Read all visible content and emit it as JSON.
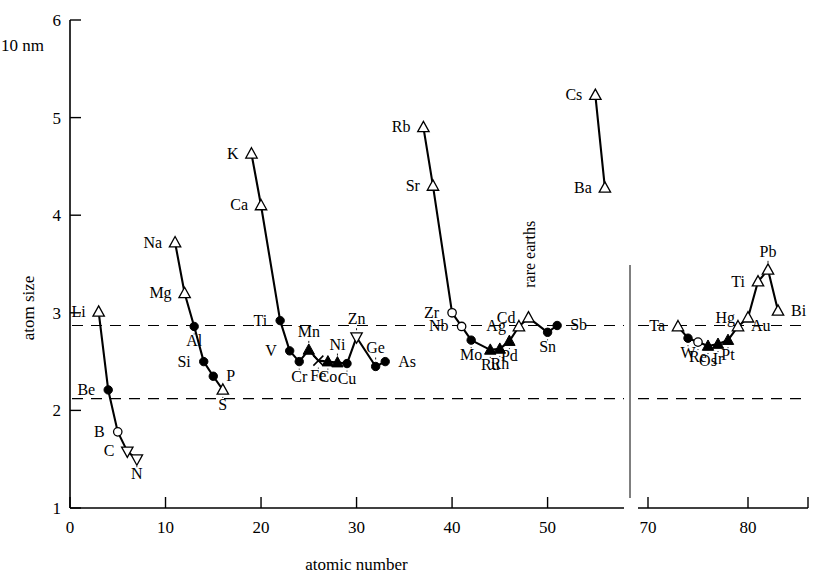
{
  "figure": {
    "y_axis_title": "atom size",
    "y_unit_label": "10 nm",
    "x_axis_title": "atomic number",
    "rare_earths_label": "rare earths"
  },
  "chart_data": {
    "type": "line",
    "title": "",
    "xlabel": "atomic number",
    "ylabel": "atom size",
    "y_unit": "10 nm",
    "xlim": [
      0,
      86
    ],
    "ylim": [
      1,
      6
    ],
    "grid": false,
    "legend": "none",
    "axis_break": {
      "from": 58,
      "to": 69
    },
    "x_ticks": [
      0,
      10,
      20,
      30,
      40,
      50,
      70,
      80
    ],
    "y_ticks": [
      1,
      2,
      3,
      4,
      5,
      6
    ],
    "reference_lines": [
      {
        "y": 2.87,
        "style": "dashed"
      },
      {
        "y": 2.12,
        "style": "dashed"
      }
    ],
    "annotations": [
      {
        "text": "rare earths",
        "x": 58.5,
        "y": 3.6,
        "rotation": -90
      }
    ],
    "series": [
      {
        "name": "Period 2",
        "points": [
          {
            "label": "Li",
            "x": 3,
            "y": 3.01,
            "marker": "triangle-up-open",
            "label_pos": "left"
          },
          {
            "label": "Be",
            "x": 4,
            "y": 2.21,
            "marker": "circle-filled",
            "label_pos": "left"
          },
          {
            "label": "B",
            "x": 5,
            "y": 1.78,
            "marker": "circle-open",
            "label_pos": "left"
          },
          {
            "label": "C",
            "x": 6,
            "y": 1.58,
            "marker": "triangle-down-open",
            "label_pos": "left"
          },
          {
            "label": "N",
            "x": 7,
            "y": 1.5,
            "marker": "triangle-down-open",
            "label_pos": "below"
          }
        ]
      },
      {
        "name": "Period 3",
        "points": [
          {
            "label": "Na",
            "x": 11,
            "y": 3.72,
            "marker": "triangle-up-open",
            "label_pos": "left"
          },
          {
            "label": "Mg",
            "x": 12,
            "y": 3.2,
            "marker": "triangle-up-open",
            "label_pos": "left"
          },
          {
            "label": "Al",
            "x": 13,
            "y": 2.86,
            "marker": "circle-filled",
            "label_pos": "below"
          },
          {
            "label": "Si",
            "x": 14,
            "y": 2.5,
            "marker": "circle-filled",
            "label_pos": "left"
          },
          {
            "label": "P",
            "x": 15,
            "y": 2.35,
            "marker": "circle-filled",
            "label_pos": "right"
          },
          {
            "label": "S",
            "x": 16,
            "y": 2.21,
            "marker": "triangle-up-open",
            "label_pos": "below"
          }
        ]
      },
      {
        "name": "Period 4",
        "points": [
          {
            "label": "K",
            "x": 19,
            "y": 4.63,
            "marker": "triangle-up-open",
            "label_pos": "left"
          },
          {
            "label": "Ca",
            "x": 20,
            "y": 4.1,
            "marker": "triangle-up-open",
            "label_pos": "left"
          },
          {
            "label": "Ti",
            "x": 22,
            "y": 2.92,
            "marker": "circle-filled",
            "label_pos": "left"
          },
          {
            "label": "V",
            "x": 23,
            "y": 2.61,
            "marker": "circle-filled",
            "label_pos": "left"
          },
          {
            "label": "Cr",
            "x": 24,
            "y": 2.5,
            "marker": "circle-filled",
            "label_pos": "below"
          },
          {
            "label": "Mn",
            "x": 25,
            "y": 2.62,
            "marker": "triangle-up-filled",
            "label_pos": "above"
          },
          {
            "label": "Fe",
            "x": 26,
            "y": 2.51,
            "marker": "cross",
            "label_pos": "below"
          },
          {
            "label": "Co",
            "x": 27,
            "y": 2.5,
            "marker": "triangle-up-filled",
            "label_pos": "below"
          },
          {
            "label": "Ni",
            "x": 28,
            "y": 2.49,
            "marker": "triangle-up-filled",
            "label_pos": "above"
          },
          {
            "label": "Cu",
            "x": 29,
            "y": 2.48,
            "marker": "circle-filled",
            "label_pos": "below"
          },
          {
            "label": "Zn",
            "x": 30,
            "y": 2.75,
            "marker": "triangle-down-open",
            "label_pos": "above"
          },
          {
            "label": "Ge",
            "x": 32,
            "y": 2.45,
            "marker": "circle-filled",
            "label_pos": "above"
          },
          {
            "label": "As",
            "x": 33,
            "y": 2.5,
            "marker": "circle-filled",
            "label_pos": "right"
          }
        ]
      },
      {
        "name": "Period 5",
        "points": [
          {
            "label": "Rb",
            "x": 37,
            "y": 4.9,
            "marker": "triangle-up-open",
            "label_pos": "left"
          },
          {
            "label": "Sr",
            "x": 38,
            "y": 4.3,
            "marker": "triangle-up-open",
            "label_pos": "left"
          },
          {
            "label": "Zr",
            "x": 40,
            "y": 3.0,
            "marker": "circle-open",
            "label_pos": "left"
          },
          {
            "label": "Nb",
            "x": 41,
            "y": 2.86,
            "marker": "circle-open",
            "label_pos": "left"
          },
          {
            "label": "Mo",
            "x": 42,
            "y": 2.72,
            "marker": "circle-filled",
            "label_pos": "below"
          },
          {
            "label": "Ru",
            "x": 44,
            "y": 2.62,
            "marker": "triangle-up-filled",
            "label_pos": "below"
          },
          {
            "label": "Rh",
            "x": 45,
            "y": 2.63,
            "marker": "triangle-up-filled",
            "label_pos": "below"
          },
          {
            "label": "Pd",
            "x": 46,
            "y": 2.71,
            "marker": "triangle-up-filled",
            "label_pos": "below"
          },
          {
            "label": "Ag",
            "x": 47,
            "y": 2.86,
            "marker": "triangle-up-open",
            "label_pos": "left"
          },
          {
            "label": "Cd",
            "x": 48,
            "y": 2.95,
            "marker": "triangle-up-open",
            "label_pos": "left"
          },
          {
            "label": "Sn",
            "x": 50,
            "y": 2.8,
            "marker": "circle-filled",
            "label_pos": "below"
          },
          {
            "label": "Sb",
            "x": 51,
            "y": 2.87,
            "marker": "circle-filled",
            "label_pos": "right"
          }
        ]
      },
      {
        "name": "Period 6 alkali",
        "points": [
          {
            "label": "Cs",
            "x": 55,
            "y": 5.23,
            "marker": "triangle-up-open",
            "label_pos": "left"
          },
          {
            "label": "Ba",
            "x": 56,
            "y": 4.28,
            "marker": "triangle-up-open",
            "label_pos": "left"
          }
        ]
      },
      {
        "name": "Period 6",
        "points": [
          {
            "label": "Ta",
            "x": 73,
            "y": 2.86,
            "marker": "triangle-up-open",
            "label_pos": "left"
          },
          {
            "label": "W",
            "x": 74,
            "y": 2.74,
            "marker": "circle-filled",
            "label_pos": "below"
          },
          {
            "label": "Re",
            "x": 75,
            "y": 2.7,
            "marker": "circle-open",
            "label_pos": "below"
          },
          {
            "label": "Os",
            "x": 76,
            "y": 2.66,
            "marker": "triangle-up-filled",
            "label_pos": "below"
          },
          {
            "label": "Ir",
            "x": 77,
            "y": 2.68,
            "marker": "triangle-up-filled",
            "label_pos": "below"
          },
          {
            "label": "Pt",
            "x": 78,
            "y": 2.72,
            "marker": "triangle-up-filled",
            "label_pos": "below"
          },
          {
            "label": "Au",
            "x": 79,
            "y": 2.86,
            "marker": "triangle-up-open",
            "label_pos": "right"
          },
          {
            "label": "Hg",
            "x": 80,
            "y": 2.95,
            "marker": "triangle-up-open",
            "label_pos": "left"
          },
          {
            "label": "Ti",
            "x": 81,
            "y": 3.32,
            "marker": "triangle-up-open",
            "label_pos": "left"
          },
          {
            "label": "Pb",
            "x": 82,
            "y": 3.44,
            "marker": "triangle-up-open",
            "label_pos": "above"
          },
          {
            "label": "Bi",
            "x": 83,
            "y": 3.02,
            "marker": "triangle-up-open",
            "label_pos": "right"
          }
        ]
      }
    ]
  }
}
